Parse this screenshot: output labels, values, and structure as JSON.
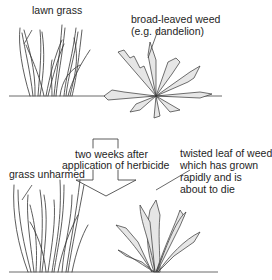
{
  "diagram": {
    "top": {
      "labels": {
        "lawn_grass": "lawn grass",
        "weed_line1": "broad-leaved weed",
        "weed_line2": "(e.g. dandelion)"
      }
    },
    "transition": {
      "line1": "two weeks after",
      "line2": "application of herbicide"
    },
    "bottom": {
      "labels": {
        "grass_unharmed": "grass unharmed",
        "weed_line1": "twisted leaf of weed",
        "weed_line2": "which has grown",
        "weed_line3": "rapidly and is",
        "weed_line4": "about to die"
      }
    },
    "colors": {
      "ink": "#333333",
      "leaf_fill": "#e6e6e6",
      "background": "#ffffff"
    }
  }
}
